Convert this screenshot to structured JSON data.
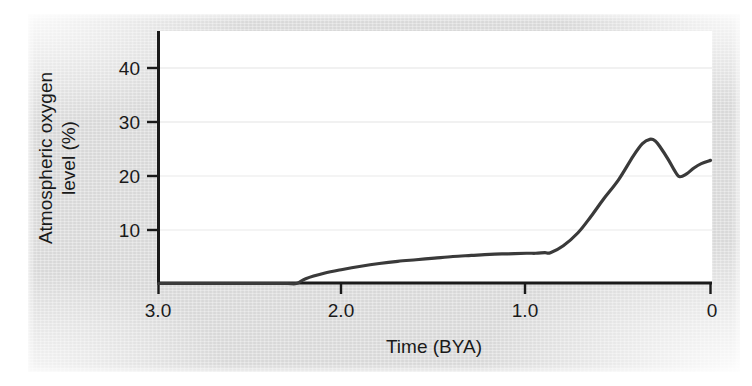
{
  "figure": {
    "background_color": "#dcdcdc",
    "plot_background_color": "#ffffff",
    "axis_color": "#1a1a1a",
    "curve_color": "#3a3a3a"
  },
  "chart_data": {
    "type": "line",
    "title": "",
    "subtitle": "",
    "xlabel": "Time (BYA)",
    "ylabel": "Atmospheric oxygen level (%)",
    "ylabel_line1": "Atmospheric oxygen",
    "ylabel_line2": "level (%)",
    "xlim": [
      3.0,
      0
    ],
    "ylim": [
      0,
      45
    ],
    "x_reversed": true,
    "grid": "faint horizontal gridlines at y ticks",
    "legend": "none",
    "xticks": [
      3.0,
      2.0,
      1.0,
      0
    ],
    "xtick_labels": [
      "3.0",
      "2.0",
      "1.0",
      "0"
    ],
    "yticks": [
      10,
      20,
      30,
      40
    ],
    "ytick_labels": [
      "10",
      "20",
      "30",
      "40"
    ],
    "series": [
      {
        "name": "Atmospheric oxygen level",
        "x": [
          3.0,
          2.6,
          2.4,
          2.3,
          2.25,
          2.2,
          2.1,
          2.0,
          1.9,
          1.8,
          1.7,
          1.6,
          1.5,
          1.4,
          1.3,
          1.2,
          1.1,
          1.0,
          0.95,
          0.9,
          0.87,
          0.8,
          0.72,
          0.65,
          0.58,
          0.5,
          0.42,
          0.37,
          0.33,
          0.3,
          0.27,
          0.23,
          0.2,
          0.17,
          0.13,
          0.09,
          0.05,
          0.0
        ],
        "y": [
          0.0,
          0.0,
          0.0,
          0.0,
          0.0,
          0.9,
          1.9,
          2.6,
          3.2,
          3.7,
          4.1,
          4.4,
          4.7,
          5.0,
          5.2,
          5.4,
          5.5,
          5.6,
          5.6,
          5.7,
          5.7,
          7.0,
          9.4,
          12.4,
          15.7,
          19.2,
          23.6,
          25.9,
          26.7,
          26.4,
          25.1,
          23.0,
          21.2,
          19.8,
          20.3,
          21.4,
          22.2,
          22.8
        ]
      }
    ],
    "annotations": []
  }
}
